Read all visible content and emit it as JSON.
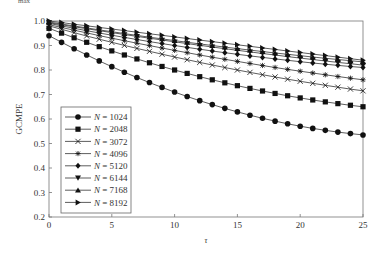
{
  "top_fragment": "max",
  "chart_data": {
    "type": "line",
    "title": "",
    "xlabel": "τ",
    "ylabel": "GCMPE",
    "xlim": [
      0,
      25
    ],
    "ylim": [
      0.2,
      1.0
    ],
    "xticks": [
      0,
      5,
      10,
      15,
      20,
      25
    ],
    "yticks": [
      0.2,
      0.3,
      0.4,
      0.5,
      0.6,
      0.7,
      0.8,
      0.9,
      1.0
    ],
    "grid": false,
    "legend_position": "lower left",
    "x": [
      0,
      1,
      2,
      3,
      4,
      5,
      6,
      7,
      8,
      9,
      10,
      11,
      12,
      13,
      14,
      15,
      16,
      17,
      18,
      19,
      20,
      21,
      22,
      23,
      24,
      25
    ],
    "series": [
      {
        "name": "N = 1024",
        "marker": "circle",
        "start": 0.94,
        "mid": 0.71,
        "end": 0.535
      },
      {
        "name": "N = 2048",
        "marker": "square",
        "start": 0.97,
        "mid": 0.8,
        "end": 0.65
      },
      {
        "name": "N = 3072",
        "marker": "x",
        "start": 0.98,
        "mid": 0.853,
        "end": 0.715
      },
      {
        "name": "N = 4096",
        "marker": "star",
        "start": 0.985,
        "mid": 0.88,
        "end": 0.76
      },
      {
        "name": "N = 5120",
        "marker": "diamond",
        "start": 0.99,
        "mid": 0.9,
        "end": 0.81
      },
      {
        "name": "N = 6144",
        "marker": "triangle-down",
        "start": 0.993,
        "mid": 0.915,
        "end": 0.82
      },
      {
        "name": "N = 7168",
        "marker": "triangle-up",
        "start": 0.996,
        "mid": 0.92,
        "end": 0.833
      },
      {
        "name": "N = 8192",
        "marker": "triangle-right",
        "start": 1.0,
        "mid": 0.935,
        "end": 0.84
      }
    ]
  }
}
